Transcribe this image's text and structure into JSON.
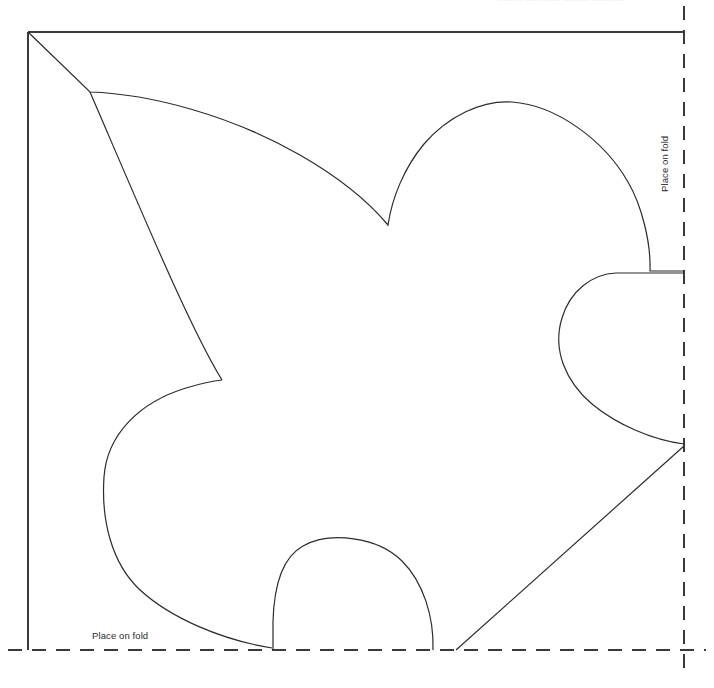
{
  "page": {
    "width": 714,
    "height": 688,
    "background": "#ffffff"
  },
  "annotations": {
    "top_clipped_note": {
      "text": "…………  …… ……… ………… ……………",
      "description": "clipped-text-fragment",
      "color": "#d9d9dd"
    },
    "fold_label_right": {
      "text": "Place on fold",
      "orientation": "vertical",
      "color": "#2b2b2b"
    },
    "fold_label_bottom": {
      "text": "Place on fold",
      "orientation": "horizontal",
      "color": "#2b2b2b"
    }
  },
  "frame": {
    "stroke": "#3a3a3a",
    "stroke_width": 1.2,
    "dash_stroke": "#3a3a3a",
    "dash_pattern": "14 10",
    "left_x": 28,
    "top_y": 32,
    "right_x": 684,
    "bottom_y": 650,
    "solid_edges": [
      "left",
      "top"
    ],
    "dashed_edges": [
      "right",
      "bottom"
    ]
  },
  "shape": {
    "name": "quarter-leaf-template",
    "stroke": "#2b2b2b",
    "stroke_width": 1.2,
    "fill": "none",
    "path": "M 28 32 L 90 92 C 170 97 300 150 388 225 C 395 185 430 128 478 106 C 540 82 610 126 641 186 C 652 210 652 248 650 271 L 684 271 L 684 273 L 618 273 C 592 273 566 292 560 330 C 556 366 590 410 630 428 C 650 437 670 442 684 444 L 684 446 L 455 650 L 432 650 C 434 612 422 576 400 558 C 372 535 320 535 295 552 C 278 564 272 590 273 650 L 272 650 C 230 645 175 625 140 595 C 110 568 100 520 103 470 C 107 430 150 396 222 380 C 180 330 120 200 90 92 Z",
    "vertices": {
      "top_left_corner": [
        28,
        32
      ],
      "shoulder": [
        90,
        92
      ],
      "upper_v_notch": [
        388,
        225
      ],
      "right_lobe_top_edge": [
        650,
        271
      ],
      "right_notch_inner": [
        560,
        330
      ],
      "right_lobe_bottom_edge": [
        684,
        444
      ],
      "diagonal_bottom": [
        455,
        650
      ],
      "bottom_arch_right": [
        432,
        650
      ],
      "bottom_arch_peak": [
        352,
        545
      ],
      "bottom_arch_left": [
        273,
        650
      ],
      "left_lobe_outer": [
        103,
        470
      ],
      "left_v_notch": [
        222,
        380
      ]
    }
  }
}
